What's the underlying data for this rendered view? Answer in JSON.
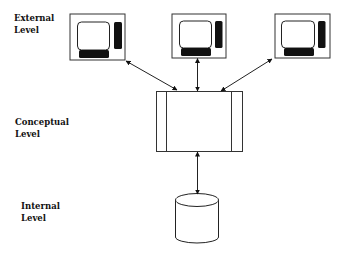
{
  "diagram": {
    "levels": [
      {
        "id": "external",
        "label": "External\nLevel"
      },
      {
        "id": "conceptual",
        "label": "Conceptual\nLevel"
      },
      {
        "id": "internal",
        "label": "Internal\nLevel"
      }
    ],
    "nodes": [
      {
        "id": "monitor-1",
        "type": "monitor",
        "level": "external"
      },
      {
        "id": "monitor-2",
        "type": "monitor",
        "level": "external"
      },
      {
        "id": "monitor-3",
        "type": "monitor",
        "level": "external"
      },
      {
        "id": "conceptual-schema",
        "type": "box",
        "level": "conceptual"
      },
      {
        "id": "database",
        "type": "cylinder",
        "level": "internal"
      }
    ],
    "edges": [
      {
        "from": "monitor-1",
        "to": "conceptual-schema",
        "direction": "both"
      },
      {
        "from": "monitor-2",
        "to": "conceptual-schema",
        "direction": "both"
      },
      {
        "from": "monitor-3",
        "to": "conceptual-schema",
        "direction": "both"
      },
      {
        "from": "conceptual-schema",
        "to": "database",
        "direction": "both"
      }
    ],
    "colors": {
      "stroke": "#222222",
      "fill": "#ffffff",
      "solid": "#111111"
    }
  }
}
